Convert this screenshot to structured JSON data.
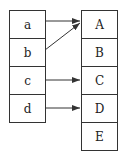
{
  "diagram": {
    "left_set": [
      "a",
      "b",
      "c",
      "d"
    ],
    "right_set": [
      "A",
      "B",
      "C",
      "D",
      "E"
    ],
    "mappings": [
      {
        "from": "a",
        "to": "A"
      },
      {
        "from": "b",
        "to": "A"
      },
      {
        "from": "c",
        "to": "C"
      },
      {
        "from": "d",
        "to": "D"
      }
    ]
  },
  "colors": {
    "line": "#333333",
    "text": "#222222"
  }
}
